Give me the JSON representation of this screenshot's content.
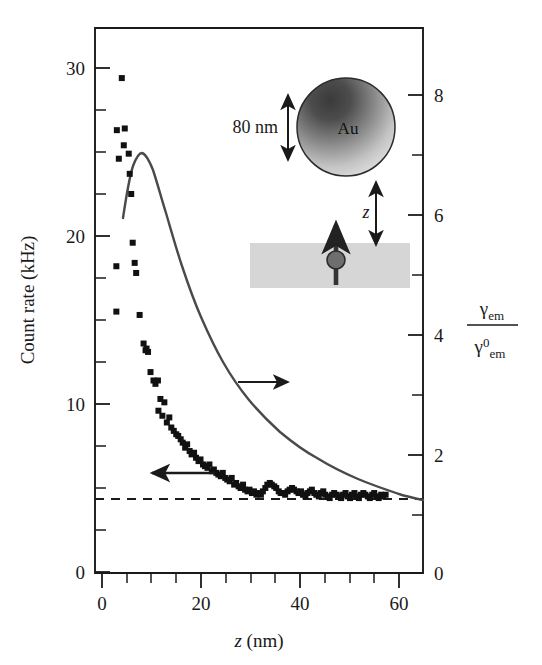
{
  "figure": {
    "background_color": "#ffffff",
    "ink_color": "#1a1a1a",
    "curve_color": "#444444",
    "marker_color": "#111111"
  },
  "axes": {
    "left": {
      "title": "Count rate (kHz)",
      "tick_labels": [
        "0",
        "10",
        "20",
        "30"
      ],
      "tick_values": [
        0,
        10,
        20,
        30
      ],
      "range": [
        0,
        32.4
      ],
      "minor_tick_step": 2.5
    },
    "bottom": {
      "title_italic": "z",
      "title_unit": "(nm)",
      "tick_labels": [
        "0",
        "20",
        "40",
        "60"
      ],
      "tick_values": [
        0,
        20,
        40,
        60
      ],
      "range": [
        -1.5,
        66
      ],
      "minor_tick_step": 5
    },
    "right": {
      "title_numerator_symbol": "γ",
      "title_numerator_sub": "em",
      "title_denominator_symbol": "γ",
      "title_denominator_sub": "em",
      "title_denominator_sup": "0",
      "tick_labels": [
        "0",
        "2",
        "4",
        "6",
        "8"
      ],
      "tick_values": [
        0,
        2,
        4,
        6,
        8
      ],
      "range": [
        0,
        9.1
      ],
      "minor_tick_step": 0.5
    }
  },
  "annotations": {
    "arrow_right": {
      "name": "arrow-to-right-axis",
      "label": "",
      "x": 37,
      "y": 11.3
    },
    "arrow_left": {
      "name": "arrow-to-left-axis",
      "label": "",
      "x": 23,
      "y": 5.9
    },
    "dashed_line": {
      "label": "",
      "y_count_rate": 4.35
    }
  },
  "inset": {
    "size_label": "80 nm",
    "sphere_label": "Au",
    "gap_label": "z",
    "sphere_diameter_nm": 80
  },
  "chart_data": {
    "type": "scatter",
    "title": "",
    "xlabel": "z (nm)",
    "ylabel": "Count rate (kHz)",
    "y2label": "γem / γem^0",
    "xlim": [
      -1.5,
      66
    ],
    "ylim": [
      0,
      32.4
    ],
    "y2lim": [
      0,
      9.1
    ],
    "grid": false,
    "legend": false,
    "series": [
      {
        "name": "Count rate (measured)",
        "marker": "square",
        "axis": "left",
        "points": [
          [
            4.0,
            29.4
          ],
          [
            3.0,
            26.3
          ],
          [
            4.6,
            26.4
          ],
          [
            4.4,
            25.4
          ],
          [
            3.4,
            24.6
          ],
          [
            5.4,
            24.9
          ],
          [
            5.6,
            23.7
          ],
          [
            5.9,
            22.5
          ],
          [
            2.9,
            18.2
          ],
          [
            6.2,
            19.6
          ],
          [
            6.6,
            18.4
          ],
          [
            6.9,
            17.8
          ],
          [
            2.9,
            15.5
          ],
          [
            7.6,
            15.3
          ],
          [
            8.4,
            13.6
          ],
          [
            8.8,
            13.2
          ],
          [
            9.0,
            13.3
          ],
          [
            9.8,
            11.9
          ],
          [
            9.3,
            13.1
          ],
          [
            10.4,
            11.4
          ],
          [
            10.8,
            11.2
          ],
          [
            11.3,
            11.4
          ],
          [
            11.8,
            10.3
          ],
          [
            11.4,
            9.6
          ],
          [
            12.6,
            10.1
          ],
          [
            12.2,
            9.3
          ],
          [
            13.1,
            8.9
          ],
          [
            13.6,
            9.2
          ],
          [
            14.0,
            8.6
          ],
          [
            14.5,
            8.4
          ],
          [
            15.0,
            8.2
          ],
          [
            15.4,
            8.1
          ],
          [
            15.9,
            7.9
          ],
          [
            16.3,
            7.7
          ],
          [
            16.8,
            7.4
          ],
          [
            17.2,
            7.6
          ],
          [
            17.7,
            7.2
          ],
          [
            18.1,
            7.0
          ],
          [
            18.6,
            7.1
          ],
          [
            19.0,
            6.8
          ],
          [
            19.5,
            6.6
          ],
          [
            19.9,
            6.7
          ],
          [
            20.4,
            6.4
          ],
          [
            20.8,
            6.3
          ],
          [
            21.3,
            6.2
          ],
          [
            21.7,
            6.4
          ],
          [
            22.2,
            6.0
          ],
          [
            22.6,
            6.1
          ],
          [
            23.1,
            5.9
          ],
          [
            23.5,
            5.8
          ],
          [
            24.0,
            5.7
          ],
          [
            24.4,
            5.9
          ],
          [
            24.9,
            5.6
          ],
          [
            25.3,
            5.5
          ],
          [
            25.8,
            5.4
          ],
          [
            26.2,
            5.6
          ],
          [
            26.7,
            5.2
          ],
          [
            27.1,
            5.3
          ],
          [
            27.6,
            5.1
          ],
          [
            28.0,
            5.0
          ],
          [
            28.5,
            5.2
          ],
          [
            28.9,
            4.9
          ],
          [
            29.4,
            4.8
          ],
          [
            29.8,
            4.9
          ],
          [
            30.3,
            4.7
          ],
          [
            30.7,
            4.8
          ],
          [
            31.2,
            4.6
          ],
          [
            31.6,
            4.7
          ],
          [
            32.1,
            4.6
          ],
          [
            32.5,
            4.8
          ],
          [
            33.0,
            5.0
          ],
          [
            33.4,
            5.2
          ],
          [
            33.9,
            5.3
          ],
          [
            34.3,
            5.2
          ],
          [
            34.8,
            5.1
          ],
          [
            35.2,
            5.0
          ],
          [
            35.7,
            4.8
          ],
          [
            36.1,
            4.7
          ],
          [
            36.6,
            4.7
          ],
          [
            37.0,
            4.6
          ],
          [
            37.5,
            4.8
          ],
          [
            37.9,
            4.9
          ],
          [
            38.4,
            5.0
          ],
          [
            38.8,
            4.9
          ],
          [
            39.3,
            4.8
          ],
          [
            39.7,
            4.7
          ],
          [
            40.2,
            4.8
          ],
          [
            40.6,
            4.6
          ],
          [
            41.1,
            4.5
          ],
          [
            41.5,
            4.7
          ],
          [
            42.0,
            4.8
          ],
          [
            42.4,
            4.9
          ],
          [
            42.9,
            4.7
          ],
          [
            43.3,
            4.6
          ],
          [
            43.8,
            4.5
          ],
          [
            44.2,
            4.7
          ],
          [
            44.7,
            4.8
          ],
          [
            45.1,
            4.6
          ],
          [
            45.6,
            4.5
          ],
          [
            46.0,
            4.4
          ],
          [
            46.5,
            4.6
          ],
          [
            46.9,
            4.7
          ],
          [
            47.4,
            4.6
          ],
          [
            47.8,
            4.5
          ],
          [
            48.3,
            4.4
          ],
          [
            48.7,
            4.6
          ],
          [
            49.2,
            4.7
          ],
          [
            49.6,
            4.5
          ],
          [
            50.1,
            4.4
          ],
          [
            50.5,
            4.6
          ],
          [
            51.0,
            4.7
          ],
          [
            51.4,
            4.5
          ],
          [
            51.9,
            4.4
          ],
          [
            52.3,
            4.6
          ],
          [
            52.8,
            4.7
          ],
          [
            53.2,
            4.6
          ],
          [
            53.7,
            4.5
          ],
          [
            54.1,
            4.4
          ],
          [
            54.6,
            4.6
          ],
          [
            55.0,
            4.7
          ],
          [
            55.5,
            4.5
          ],
          [
            55.9,
            4.4
          ],
          [
            56.4,
            4.6
          ],
          [
            56.8,
            4.5
          ],
          [
            57.3,
            4.6
          ]
        ]
      }
    ],
    "curve": {
      "name": "Calculated emission rate enhancement",
      "axis": "right",
      "style": "solid",
      "points": [
        [
          1.6,
          5.75
        ],
        [
          2.0,
          6.3
        ],
        [
          2.4,
          6.72
        ],
        [
          2.8,
          6.93
        ],
        [
          3.2,
          7.02
        ],
        [
          3.6,
          7.05
        ],
        [
          4.0,
          7.03
        ],
        [
          4.4,
          6.92
        ],
        [
          4.9,
          6.7
        ],
        [
          5.4,
          6.42
        ],
        [
          6.0,
          6.05
        ],
        [
          6.6,
          5.68
        ],
        [
          7.2,
          5.32
        ],
        [
          7.9,
          4.95
        ],
        [
          8.6,
          4.62
        ],
        [
          9.4,
          4.3
        ],
        [
          10.2,
          4.02
        ],
        [
          11.0,
          3.78
        ],
        [
          12.0,
          3.52
        ],
        [
          13.0,
          3.3
        ],
        [
          14.0,
          3.1
        ],
        [
          15.2,
          2.9
        ],
        [
          16.4,
          2.73
        ],
        [
          17.8,
          2.56
        ],
        [
          19.2,
          2.41
        ],
        [
          20.8,
          2.27
        ],
        [
          22.4,
          2.15
        ],
        [
          24.2,
          2.03
        ],
        [
          26.0,
          1.93
        ],
        [
          28.0,
          1.83
        ],
        [
          30.0,
          1.74
        ],
        [
          32.2,
          1.66
        ],
        [
          34.4,
          1.59
        ],
        [
          36.8,
          1.52
        ],
        [
          39.2,
          1.46
        ],
        [
          41.8,
          1.41
        ],
        [
          44.4,
          1.36
        ],
        [
          47.2,
          1.31
        ],
        [
          50.0,
          1.27
        ],
        [
          53.0,
          1.23
        ],
        [
          56.0,
          1.2
        ],
        [
          59.0,
          1.17
        ],
        [
          62.0,
          1.14
        ],
        [
          65.0,
          1.12
        ],
        [
          66.0,
          1.11
        ]
      ]
    },
    "reference_line": {
      "name": "background-level",
      "style": "dashed",
      "axis": "left",
      "y": 4.35
    }
  }
}
